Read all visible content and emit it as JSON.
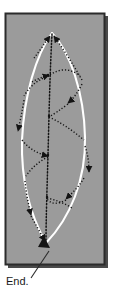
{
  "figure": {
    "panel": {
      "fill_color": "#9b9b9b",
      "border_color": "#2b2b2b",
      "shadow_color": "#4a4a4a",
      "x": 5,
      "y": 13,
      "width": 100,
      "height": 252
    },
    "leaf": {
      "outline_color": "#ffffff",
      "outline_style": "solid",
      "vein_color": "#1a1a1a",
      "vein_style": "dotted",
      "apex": {
        "x": 52,
        "y": 33
      },
      "base": {
        "x": 46,
        "y": 243
      },
      "midrib_label": "midrib"
    },
    "annotation": {
      "label": "End.",
      "label_x": 6,
      "label_y": 285,
      "leader_from": {
        "x": 30,
        "y": 277
      },
      "leader_to": {
        "x": 48,
        "y": 250
      },
      "leader_color": "#2b2b2b",
      "arrow_target": {
        "x": 45,
        "y": 242
      }
    },
    "arrowheads": [
      {
        "id": "arrow-apex-left",
        "x": 41,
        "y": 48,
        "angle": 250,
        "note": "left upper vein toward apex"
      },
      {
        "id": "arrow-apex-upper-mid",
        "x": 45,
        "y": 70,
        "angle": 285,
        "note": "left vein junction inbound"
      },
      {
        "id": "arrow-upper-right",
        "x": 78,
        "y": 72,
        "angle": 240,
        "note": "right upper vein toward apex"
      },
      {
        "id": "arrow-right-upper-mid",
        "x": 70,
        "y": 97,
        "angle": 205,
        "note": "right vein toward midrib"
      },
      {
        "id": "arrow-left-mid",
        "x": 17,
        "y": 128,
        "angle": 255,
        "note": "left margin vein downward"
      },
      {
        "id": "arrow-left-inner-mid",
        "x": 36,
        "y": 158,
        "angle": 200,
        "note": "left vein toward midrib"
      },
      {
        "id": "arrow-right-mid",
        "x": 90,
        "y": 170,
        "angle": 290,
        "note": "right margin vein downward"
      },
      {
        "id": "arrow-right-lower",
        "x": 68,
        "y": 197,
        "angle": 200,
        "note": "right lower vein toward midrib"
      },
      {
        "id": "arrow-left-lower",
        "x": 29,
        "y": 212,
        "angle": 250,
        "note": "left lower vein downward"
      },
      {
        "id": "arrow-base-end",
        "x": 45,
        "y": 242,
        "angle": 300,
        "note": "base terminus, end point"
      }
    ],
    "vein_junctions": [
      {
        "x": 48,
        "y": 75
      },
      {
        "x": 49,
        "y": 116
      },
      {
        "x": 48,
        "y": 155
      },
      {
        "x": 47,
        "y": 197
      },
      {
        "x": 46,
        "y": 231
      }
    ]
  }
}
